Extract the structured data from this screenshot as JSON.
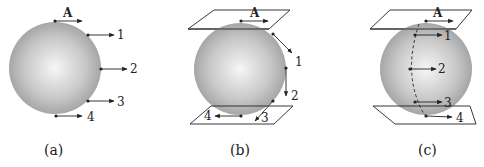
{
  "figure": {
    "panels": [
      {
        "id": "a",
        "caption": "(a)",
        "point_a_label": "A",
        "points": [
          {
            "label": "1"
          },
          {
            "label": "2"
          },
          {
            "label": "3"
          },
          {
            "label": "4"
          }
        ],
        "description": "Sphere with horizontal arrows at points A,1,2,3,4 along right edge"
      },
      {
        "id": "b",
        "caption": "(b)",
        "point_a_label": "A",
        "points": [
          {
            "label": "1"
          },
          {
            "label": "2"
          },
          {
            "label": "3"
          },
          {
            "label": "4"
          }
        ],
        "description": "Sphere between two tangent planes; arrows tangent to meridian"
      },
      {
        "id": "c",
        "caption": "(c)",
        "point_a_label": "A",
        "points": [
          {
            "label": "1"
          },
          {
            "label": "2"
          },
          {
            "label": "3"
          },
          {
            "label": "4"
          }
        ],
        "description": "Sphere between two tangent planes; dashed meridian with parallel horizontal arrows"
      }
    ]
  },
  "colors": {
    "sphere_center": "#f4f4f4",
    "sphere_edge": "#9a9a9a",
    "line": "#222222"
  }
}
